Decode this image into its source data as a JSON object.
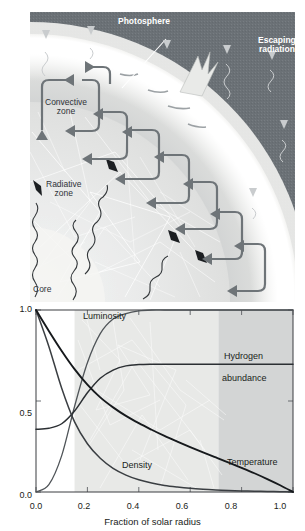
{
  "figure": {
    "illustration": {
      "labels": {
        "photosphere": "Photosphere",
        "escaping_radiation_line1": "Escaping",
        "escaping_radiation_line2": "radiation",
        "convective_zone_line1": "Convective",
        "convective_zone_line2": "zone",
        "radiative_zone_line1": "Radiative",
        "radiative_zone_line2": "zone",
        "core": "Core"
      },
      "colors": {
        "sky": "#6b7176",
        "photosphere_glow": "#ffffff",
        "convective_zone": "#d2d4d4",
        "radiative_zone": "#e4e5e3",
        "core": "#f2f2f0",
        "arrow": "#6e7478",
        "ray": "#3a3d40"
      },
      "icon_names": [
        "convection-loop-arrow-icon",
        "photon-wavy-ray-icon",
        "escaping-radiation-arrow-icon",
        "photosphere-leader-line-icon"
      ]
    }
  },
  "chart_data": {
    "type": "line",
    "title": "",
    "xlabel": "Fraction of solar radius",
    "ylabel": "",
    "xlim": [
      0.0,
      1.0
    ],
    "ylim": [
      0.0,
      1.0
    ],
    "xticks": [
      0.0,
      0.2,
      0.4,
      0.6,
      0.8,
      1.0
    ],
    "xticklabels": [
      "0.0",
      "0.2",
      "0.4",
      "0.6",
      "0.8",
      "1.0"
    ],
    "yticks": [
      0.0,
      0.5,
      1.0
    ],
    "yticklabels": [
      "0.0",
      "0.5",
      "1.0"
    ],
    "grid": false,
    "legend_position": "inline-labels",
    "x": [
      0.0,
      0.05,
      0.1,
      0.15,
      0.2,
      0.25,
      0.3,
      0.35,
      0.4,
      0.45,
      0.5,
      0.55,
      0.6,
      0.65,
      0.7,
      0.75,
      0.8,
      0.85,
      0.9,
      0.95,
      1.0
    ],
    "series": [
      {
        "name": "Luminosity",
        "label": "Luminosity",
        "color": "#4f5458",
        "values": [
          0.0,
          0.04,
          0.2,
          0.47,
          0.71,
          0.87,
          0.95,
          0.98,
          0.995,
          1.0,
          1.0,
          1.0,
          1.0,
          1.0,
          1.0,
          1.0,
          1.0,
          1.0,
          1.0,
          1.0,
          1.0
        ]
      },
      {
        "name": "Hydrogen abundance",
        "label_line1": "Hydrogen",
        "label_line2": "abundance",
        "color": "#2b2f33",
        "values": [
          0.345,
          0.35,
          0.375,
          0.445,
          0.545,
          0.625,
          0.67,
          0.693,
          0.7,
          0.702,
          0.702,
          0.702,
          0.702,
          0.702,
          0.702,
          0.702,
          0.702,
          0.702,
          0.702,
          0.702,
          0.702
        ]
      },
      {
        "name": "Density",
        "label": "Density",
        "color": "#3a3e42",
        "values": [
          1.0,
          0.8,
          0.57,
          0.385,
          0.265,
          0.185,
          0.13,
          0.093,
          0.067,
          0.049,
          0.036,
          0.027,
          0.02,
          0.015,
          0.011,
          0.008,
          0.006,
          0.004,
          0.003,
          0.002,
          0.0
        ]
      },
      {
        "name": "Temperature",
        "label": "Temperature",
        "color": "#16191c",
        "values": [
          1.0,
          0.885,
          0.775,
          0.675,
          0.59,
          0.52,
          0.465,
          0.418,
          0.378,
          0.342,
          0.308,
          0.277,
          0.247,
          0.218,
          0.19,
          0.162,
          0.133,
          0.103,
          0.071,
          0.037,
          0.0
        ]
      }
    ],
    "shaded_bands": [
      {
        "name": "core-band",
        "from": 0.0,
        "to": 0.15,
        "color": "#ffffff"
      },
      {
        "name": "radiative-zone-band",
        "from": 0.15,
        "to": 0.71,
        "color": "#e8e9e7"
      },
      {
        "name": "convective-zone-band",
        "from": 0.71,
        "to": 1.0,
        "color": "#d3d5d5"
      }
    ]
  }
}
